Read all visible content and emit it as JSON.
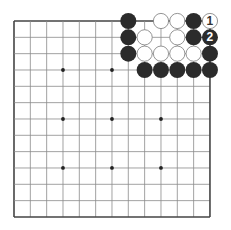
{
  "board": {
    "size": 13,
    "origin_x": 14,
    "origin_y": 21,
    "spacing": 16.33,
    "stone_radius": 8,
    "line_color": "#8a8a8a",
    "border_color": "#444444",
    "background": "#ffffff"
  },
  "star_points": [
    [
      3,
      3
    ],
    [
      3,
      6
    ],
    [
      3,
      9
    ],
    [
      6,
      3
    ],
    [
      6,
      6
    ],
    [
      6,
      9
    ],
    [
      9,
      3
    ],
    [
      9,
      6
    ],
    [
      9,
      9
    ]
  ],
  "stones": [
    {
      "col": 7,
      "row": 0,
      "color": "black"
    },
    {
      "col": 9,
      "row": 0,
      "color": "white"
    },
    {
      "col": 10,
      "row": 0,
      "color": "white"
    },
    {
      "col": 11,
      "row": 0,
      "color": "black"
    },
    {
      "col": 12,
      "row": 0,
      "color": "white",
      "label": "1"
    },
    {
      "col": 7,
      "row": 1,
      "color": "black"
    },
    {
      "col": 8,
      "row": 1,
      "color": "white"
    },
    {
      "col": 10,
      "row": 1,
      "color": "white"
    },
    {
      "col": 11,
      "row": 1,
      "color": "black"
    },
    {
      "col": 12,
      "row": 1,
      "color": "black",
      "label": "2"
    },
    {
      "col": 7,
      "row": 2,
      "color": "black"
    },
    {
      "col": 8,
      "row": 2,
      "color": "white"
    },
    {
      "col": 9,
      "row": 2,
      "color": "white"
    },
    {
      "col": 10,
      "row": 2,
      "color": "white"
    },
    {
      "col": 11,
      "row": 2,
      "color": "white"
    },
    {
      "col": 12,
      "row": 2,
      "color": "black"
    },
    {
      "col": 8,
      "row": 3,
      "color": "black"
    },
    {
      "col": 9,
      "row": 3,
      "color": "black"
    },
    {
      "col": 10,
      "row": 3,
      "color": "black"
    },
    {
      "col": 11,
      "row": 3,
      "color": "black"
    },
    {
      "col": 12,
      "row": 3,
      "color": "black"
    }
  ],
  "colors": {
    "black_stone": "#2b2b2b",
    "white_stone": "#ffffff",
    "white_stone_stroke": "#7a7a7a",
    "star_point": "#222222"
  }
}
